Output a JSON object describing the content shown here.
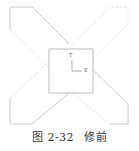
{
  "figure": {
    "caption_number": "图 2-32",
    "caption_title": "修前",
    "labels": {
      "vertical_axis": "T",
      "horizontal_axis": "E"
    },
    "colors": {
      "outline": "#bdbdbd",
      "dashed": "#d0d0d0",
      "square": "#a8a8a8"
    }
  }
}
